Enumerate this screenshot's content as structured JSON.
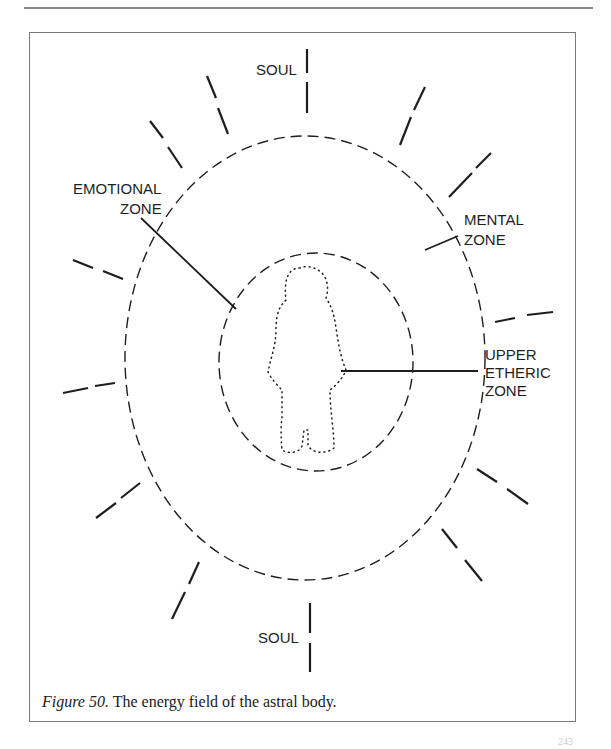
{
  "figure": {
    "number_label": "Figure 50.",
    "caption_text": "The energy field of the astral body."
  },
  "labels": {
    "soul_top": "SOUL",
    "soul_bottom": "SOUL",
    "emotional_zone_line1": "EMOTIONAL",
    "emotional_zone_line2": "ZONE",
    "mental_zone_line1": "MENTAL",
    "mental_zone_line2": "ZONE",
    "upper_etheric_line1": "UPPER",
    "upper_etheric_line2": "ETHERIC",
    "upper_etheric_line3": "ZONE"
  },
  "page": {
    "number_partial": "243"
  },
  "colors": {
    "ink": "#1e1e1e",
    "frame": "#7a7a7a",
    "rule": "#8a8a8a"
  }
}
